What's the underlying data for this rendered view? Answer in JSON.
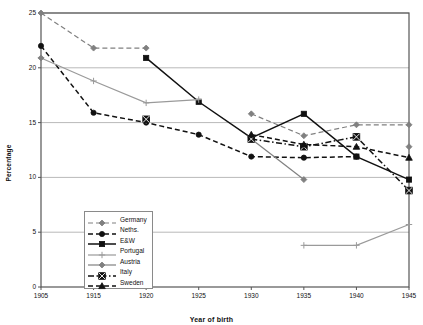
{
  "chart_data": {
    "type": "line",
    "title": "",
    "xlabel": "Year of birth",
    "ylabel": "Percentage",
    "categories": [
      "1905",
      "1915",
      "1920",
      "1925",
      "1930",
      "1935",
      "1940",
      "1945"
    ],
    "ylim": [
      0,
      25
    ],
    "yticks": [
      0,
      5,
      10,
      15,
      20,
      25
    ],
    "grid": "horizontal",
    "legend_position": "inside-bottom-left",
    "series": [
      {
        "name": "Germany",
        "color": "#808080",
        "line_style": "dashed",
        "marker": "diamond",
        "values": [
          25.0,
          21.8,
          21.8,
          null,
          15.8,
          13.8,
          14.8,
          14.8
        ]
      },
      {
        "name": "Neths.",
        "color": "#111111",
        "line_style": "dashed",
        "marker": "circle",
        "values": [
          22.0,
          15.9,
          15.0,
          13.9,
          11.9,
          11.8,
          11.9,
          null
        ]
      },
      {
        "name": "E&W",
        "color": "#111111",
        "line_style": "solid",
        "marker": "square",
        "values": [
          null,
          null,
          20.9,
          16.9,
          13.6,
          15.8,
          11.9,
          9.8
        ]
      },
      {
        "name": "Portugal",
        "color": "#9a9a9a",
        "line_style": "solid",
        "marker": "plus",
        "values": [
          20.9,
          18.8,
          16.8,
          17.1,
          null,
          3.8,
          3.8,
          5.7
        ]
      },
      {
        "name": "Austria",
        "color": "#808080",
        "line_style": "solid",
        "marker": "diamond",
        "values": [
          20.9,
          null,
          15.2,
          null,
          13.5,
          9.8,
          null,
          12.8
        ]
      },
      {
        "name": "Italy",
        "color": "#111111",
        "line_style": "dash-dot",
        "marker": "square-x",
        "values": [
          null,
          null,
          15.3,
          null,
          13.5,
          12.8,
          13.7,
          8.8
        ]
      },
      {
        "name": "Sweden",
        "color": "#111111",
        "line_style": "dashed",
        "marker": "triangle",
        "values": [
          null,
          null,
          null,
          null,
          13.9,
          13.0,
          12.8,
          11.8
        ]
      }
    ]
  },
  "legend": {
    "items": [
      {
        "label": "Germany"
      },
      {
        "label": "Neths."
      },
      {
        "label": "E&W"
      },
      {
        "label": "Portugal"
      },
      {
        "label": "Austria"
      },
      {
        "label": "Italy"
      },
      {
        "label": "Sweden"
      }
    ]
  }
}
